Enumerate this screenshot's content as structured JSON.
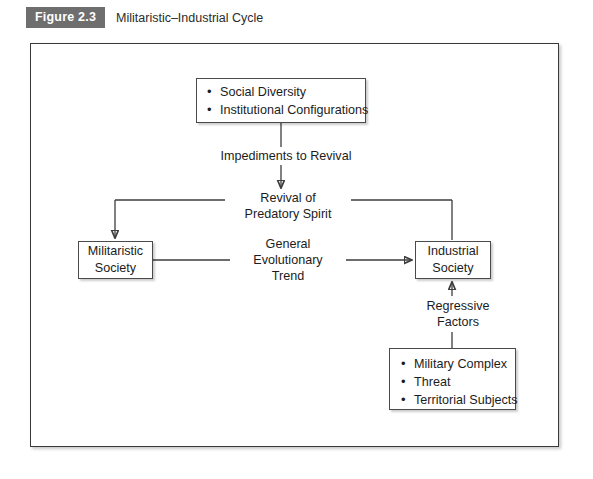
{
  "caption": {
    "figure_tag": "Figure 2.3",
    "title": "Militaristic–Industrial Cycle",
    "tag_bg_color": "#6e6e6e",
    "tag_text_color": "#ffffff"
  },
  "diagram": {
    "type": "flow-diagram",
    "nodes": {
      "top": {
        "name": "social-inputs",
        "items": [
          "Social Diversity",
          "Institutional Configurations"
        ]
      },
      "militaristic": {
        "name": "militaristic-society",
        "line1": "Militaristic",
        "line2": "Society"
      },
      "industrial": {
        "name": "industrial-society",
        "line1": "Industrial",
        "line2": "Society"
      },
      "bottom": {
        "name": "regressive-inputs",
        "items": [
          "Military Complex",
          "Threat",
          "Territorial Subjects"
        ]
      }
    },
    "labels": {
      "impediments": "Impediments to Revival",
      "revival_line1": "Revival of",
      "revival_line2": "Predatory Spirit",
      "trend_line1": "General",
      "trend_line2": "Evolutionary",
      "trend_line3": "Trend",
      "regressive_line1": "Regressive",
      "regressive_line2": "Factors"
    },
    "edges": [
      {
        "from": "social-inputs",
        "to": "impediments-to-revival",
        "arrow": "down"
      },
      {
        "from": "impediments-to-revival",
        "to": "revival-of-predatory-spirit",
        "arrow": "down"
      },
      {
        "from": "revival-of-predatory-spirit",
        "to": "militaristic-society",
        "arrow": "down-left"
      },
      {
        "from": "revival-of-predatory-spirit",
        "to": "industrial-society",
        "arrow": "down-right"
      },
      {
        "from": "militaristic-society",
        "to": "industrial-society",
        "arrow": "right",
        "label": "General Evolutionary Trend"
      },
      {
        "from": "regressive-inputs",
        "to": "industrial-society",
        "arrow": "up",
        "label": "Regressive Factors"
      }
    ],
    "stroke_color": "#3d3d3d",
    "box_border_color": "#4a4a4a",
    "frame_border_color": "#3a3a3a",
    "background_color": "#ffffff"
  }
}
